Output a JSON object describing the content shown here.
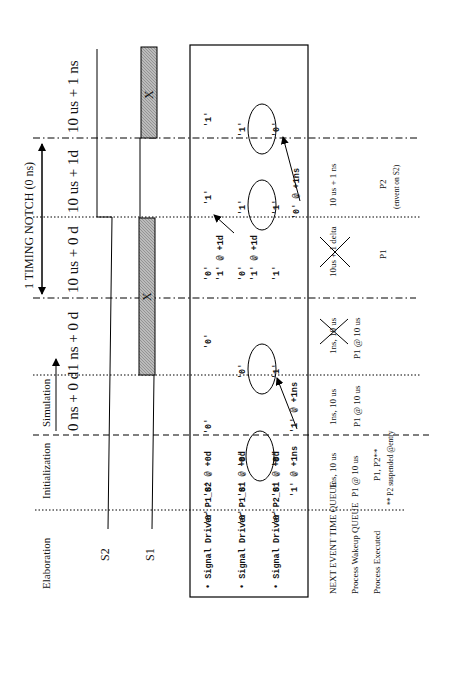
{
  "phases": {
    "elaboration": "Elaboration",
    "initialization": "Initialization",
    "simulation": "Simulation"
  },
  "timing_notch": "1 TIMING NOTCH  (0 ns)",
  "time_labels": [
    "0 ns + 0 d",
    "1 ns + 0 d",
    "10 us + 0 d",
    "10 us + 1d",
    "10 us + 1 ns"
  ],
  "signals": {
    "s2": "S2",
    "s1": "S1",
    "unknown": "X"
  },
  "drivers": [
    {
      "bullet": "•",
      "name": "Signal Driver P1_S2",
      "elab": "'0'",
      "init": "'0' @ +0d",
      "sim0": "'0'",
      "sim1": "'0'",
      "notch_a": "'0'",
      "notch_b": "'1' @ +1d",
      "notch_c": "'1'",
      "final": "'1'"
    },
    {
      "bullet": "•",
      "name": "Signal Driver P1_S1",
      "elab": "'0'",
      "init": "'0' @ +0d",
      "sim0": "'0'",
      "sim1": "'0'",
      "notch_a": "'0'",
      "notch_b": "'1' @ +1d",
      "notch_c": "'1'",
      "final": "'1'"
    },
    {
      "bullet": "•",
      "name": "Signal Driver P2_S1",
      "elab": "'0'",
      "init": "'0' @ +0d",
      "init2": "'1' @ +1ns",
      "sim0": "'0'",
      "sim0b": "'1' @ +1ns",
      "sim1": "'1'",
      "notch_a": "'1'",
      "notch_c": "'1'",
      "notch_d": "'0' @ +1ns",
      "final": "'0'"
    }
  ],
  "queues": {
    "next_event_label": "NEXT EVENT TIME QUEUE",
    "wakeup_label": "Process Wakeup QUEUE",
    "executed_label": "Process  Executed",
    "init_next_event": "1ns, 10 us",
    "init_wakeup": "P1 @ 10 us",
    "init_executed": "P1, P2**",
    "init_note": "** P2 suspended @entry",
    "sim0_next_event": "1ns, 10 us",
    "sim0_wakeup": "P1 @ 10 us",
    "sim1_next_event": "1ns, 10 us",
    "sim1_wakeup": "P1 @ 10 us",
    "notch0_next_event": "10us + 1 delta",
    "notch0_executed": "P1",
    "notch1_next_event": "10 us + 1 ns",
    "notch1_executed": "P2",
    "notch1_note": "(envent on S2)"
  }
}
